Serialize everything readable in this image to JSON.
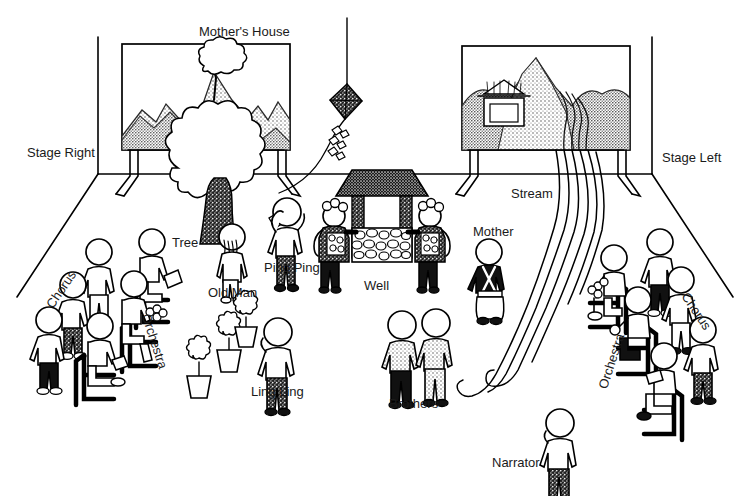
{
  "diagram": {
    "type": "theatrical stage plan",
    "background_color": "#ffffff",
    "ink_color": "#000000"
  },
  "labels": {
    "mothers_house": "Mother's House",
    "stage_right": "Stage Right",
    "stage_left": "Stage Left",
    "tree": "Tree",
    "old_man": "Old Man",
    "ping_ping": "Ping Ping",
    "well": "Well",
    "mother": "Mother",
    "stream": "Stream",
    "chorus_left": "Chorus",
    "chorus_right": "Chorus",
    "orchestra_left": "Orchestra",
    "orchestra_right": "Orchestra",
    "ling_ling": "Ling Ling",
    "brothers": "Brothers",
    "narrator": "Narrator"
  },
  "backdrops": [
    {
      "name": "mothers-house-backdrop",
      "caption": "Mother's House",
      "contents": "shaded mountain range with a tree on the summit"
    },
    {
      "name": "stream-backdrop",
      "caption": "Stream",
      "contents": "shaded mountains with pagoda house and a stream flowing down"
    }
  ],
  "props": [
    {
      "name": "tree",
      "label": "Tree"
    },
    {
      "name": "well",
      "label": "Well"
    },
    {
      "name": "kite",
      "label": "kite"
    },
    {
      "name": "flower-pots",
      "label": "flower pots",
      "count": 3
    },
    {
      "name": "stream",
      "label": "Stream"
    }
  ],
  "characters": [
    {
      "name": "old-man",
      "label": "Old Man"
    },
    {
      "name": "ping-ping",
      "label": "Ping Ping"
    },
    {
      "name": "mother",
      "label": "Mother"
    },
    {
      "name": "ling-ling",
      "label": "Ling Ling"
    },
    {
      "name": "brothers",
      "label": "Brothers",
      "count": 2
    },
    {
      "name": "narrator",
      "label": "Narrator"
    }
  ],
  "groups": [
    {
      "name": "chorus-left",
      "label": "Chorus",
      "side": "stage right",
      "members": 3
    },
    {
      "name": "orchestra-left",
      "label": "Orchestra",
      "side": "stage right",
      "members": 3
    },
    {
      "name": "chorus-right",
      "label": "Chorus",
      "side": "stage left",
      "members": 3
    },
    {
      "name": "orchestra-right",
      "label": "Orchestra",
      "side": "stage left",
      "members": 3
    }
  ]
}
